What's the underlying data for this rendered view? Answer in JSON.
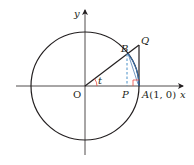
{
  "diagram": {
    "type": "unit-circle-geometry",
    "labels": {
      "y_axis": "y",
      "x_axis": "x",
      "origin": "O",
      "angle": "t",
      "point_B": "B",
      "point_Q": "Q",
      "point_P": "P",
      "point_A": "A(1, 0)"
    },
    "colors": {
      "stroke": "#231f20",
      "dashed": "#4a90c8",
      "arc": "#3a6fa8",
      "angle_mark": "#e8453c",
      "right_angle": "#e8453c"
    },
    "geometry": {
      "center": [
        85,
        86
      ],
      "radius": 54,
      "angle_deg": 37
    }
  }
}
